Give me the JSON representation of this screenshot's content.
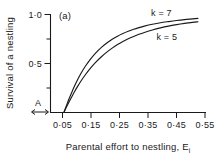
{
  "figure": {
    "panel_label": "(a)",
    "background": "#ffffff",
    "ink_color": "#1a1a1a"
  },
  "chart_data": {
    "type": "line",
    "title": "",
    "panel": "(a)",
    "xlabel": "Parental effort to nestling, E",
    "xlabel_subscript": "i",
    "ylabel": "Survival of a nestling",
    "xlim": [
      0.0,
      0.58
    ],
    "ylim": [
      0.0,
      1.0
    ],
    "grid": false,
    "x_ticks": [
      0.05,
      0.15,
      0.25,
      0.35,
      0.45,
      0.55
    ],
    "x_tick_labels": [
      "0·05",
      "0·15",
      "0·25",
      "0·35",
      "0·45",
      "0·55"
    ],
    "y_ticks": [
      0.0,
      0.25,
      0.5,
      0.75,
      1.0
    ],
    "y_tick_labels": [
      "",
      "",
      "0·5",
      "",
      "1·0"
    ],
    "y_labeled_ticks": [
      0.5,
      1.0
    ],
    "legend_position": "inline-right",
    "annotations": [
      {
        "text": "A",
        "x": 0.018,
        "y": 0.06,
        "kind": "segment-label"
      },
      {
        "text": "(a)",
        "x": 0.09,
        "y": 0.99,
        "kind": "panel-label"
      }
    ],
    "series": [
      {
        "name": "k = 7",
        "label": "k = 7",
        "color": "#1a1a1a",
        "x": [
          0.05,
          0.06,
          0.07,
          0.08,
          0.09,
          0.1,
          0.115,
          0.13,
          0.15,
          0.17,
          0.19,
          0.21,
          0.23,
          0.25,
          0.27,
          0.29,
          0.31,
          0.33,
          0.35,
          0.38,
          0.41,
          0.44,
          0.47,
          0.5,
          0.53,
          0.55
        ],
        "y": [
          0.0,
          0.075,
          0.145,
          0.21,
          0.272,
          0.33,
          0.406,
          0.472,
          0.548,
          0.611,
          0.664,
          0.709,
          0.747,
          0.779,
          0.806,
          0.829,
          0.849,
          0.866,
          0.881,
          0.9,
          0.916,
          0.928,
          0.939,
          0.948,
          0.955,
          0.96
        ]
      },
      {
        "name": "k = 5",
        "label": "k = 5",
        "color": "#1a1a1a",
        "x": [
          0.05,
          0.06,
          0.07,
          0.08,
          0.09,
          0.1,
          0.115,
          0.13,
          0.15,
          0.17,
          0.19,
          0.21,
          0.23,
          0.25,
          0.27,
          0.29,
          0.31,
          0.33,
          0.35,
          0.38,
          0.41,
          0.44,
          0.47,
          0.5,
          0.53,
          0.55
        ],
        "y": [
          0.0,
          0.058,
          0.112,
          0.164,
          0.214,
          0.261,
          0.326,
          0.385,
          0.455,
          0.516,
          0.569,
          0.616,
          0.657,
          0.693,
          0.724,
          0.752,
          0.776,
          0.798,
          0.817,
          0.842,
          0.863,
          0.881,
          0.896,
          0.909,
          0.92,
          0.926
        ]
      }
    ],
    "series_label_positions": [
      {
        "name": "k = 7",
        "x": 0.375,
        "y": 0.985
      },
      {
        "name": "k = 5",
        "x": 0.395,
        "y": 0.745
      }
    ]
  }
}
